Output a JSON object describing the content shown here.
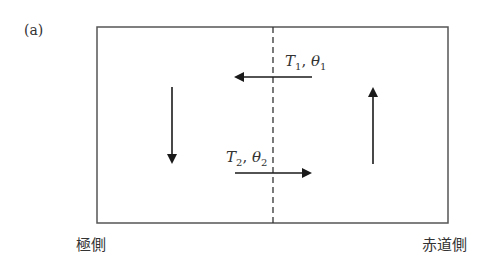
{
  "panel_label": "(a)",
  "diagram": {
    "frame": {
      "x": 97,
      "y": 27,
      "width": 351,
      "height": 196,
      "stroke": "#555555"
    },
    "divider": {
      "x": 273,
      "style": "dashed"
    },
    "arrows": [
      {
        "name": "down-arrow-left",
        "direction": "down"
      },
      {
        "name": "up-arrow-right",
        "direction": "up"
      },
      {
        "name": "upper-flow-arrow",
        "direction": "left"
      },
      {
        "name": "lower-flow-arrow",
        "direction": "right"
      }
    ],
    "upper_label": {
      "T": "T",
      "T_sub": "1",
      "sep": ", ",
      "theta": "θ",
      "theta_sub": "1"
    },
    "lower_label": {
      "T": "T",
      "T_sub": "2",
      "sep": ", ",
      "theta": "θ",
      "theta_sub": "2"
    }
  },
  "axis_labels": {
    "left": "極側",
    "right": "赤道側"
  }
}
